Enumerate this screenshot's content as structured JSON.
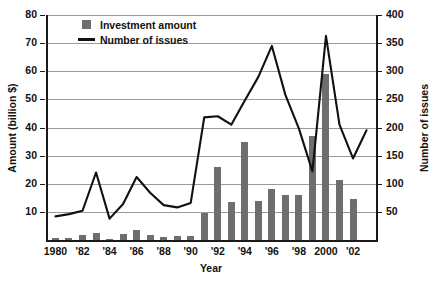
{
  "chart_data": {
    "type": "bar",
    "title": "",
    "subtitle": "",
    "xlabel": "Year",
    "ylabel": "Amount (billion $)",
    "y2label": "Number of issues",
    "grid": true,
    "legend_position": "top-left-inside",
    "x": [
      1980,
      1981,
      1982,
      1983,
      1984,
      1985,
      1986,
      1987,
      1988,
      1989,
      1990,
      1991,
      1992,
      1993,
      1994,
      1995,
      1996,
      1997,
      1998,
      1999,
      2000,
      2001,
      2002,
      2003
    ],
    "categories": [
      "1980",
      "1981",
      "1982",
      "1983",
      "1984",
      "1985",
      "1986",
      "1987",
      "1988",
      "1989",
      "1990",
      "1991",
      "1992",
      "1993",
      "1994",
      "1995",
      "1996",
      "1997",
      "1998",
      "1999",
      "2000",
      "2001",
      "2002",
      "2003"
    ],
    "xtick_labels": [
      "1980",
      "'82",
      "'84",
      "'86",
      "'88",
      "'90",
      "'92",
      "'94",
      "'96",
      "'98",
      "2000",
      "'02"
    ],
    "xtick_values": [
      1980,
      1982,
      1984,
      1986,
      1988,
      1990,
      1992,
      1994,
      1996,
      1998,
      2000,
      2002
    ],
    "xlim": [
      1979.3,
      2003.7
    ],
    "ylim": [
      0,
      80
    ],
    "ytick_labels": [
      "10",
      "20",
      "30",
      "40",
      "50",
      "60",
      "70",
      "80"
    ],
    "ytick_values": [
      10,
      20,
      30,
      40,
      50,
      60,
      70,
      80
    ],
    "y2lim": [
      0,
      400
    ],
    "y2tick_labels": [
      "50",
      "100",
      "150",
      "200",
      "250",
      "300",
      "350",
      "400"
    ],
    "y2tick_values": [
      50,
      100,
      150,
      200,
      250,
      300,
      350,
      400
    ],
    "series": [
      {
        "name": "Investment amount",
        "type": "bar",
        "axis": "left",
        "unit": "billion $",
        "color": "#6e6e6e",
        "values": [
          0.6,
          0.8,
          1.8,
          2.4,
          0.5,
          2.2,
          3.5,
          1.9,
          1.0,
          1.4,
          1.5,
          9.6,
          26.0,
          13.4,
          35.0,
          14.0,
          18.0,
          16.0,
          16.0,
          37.0,
          59.0,
          21.5,
          14.5,
          0
        ]
      },
      {
        "name": "Number of issues",
        "type": "line",
        "axis": "right",
        "unit": "issues",
        "color": "#111111",
        "values": [
          42,
          46,
          52,
          120,
          38,
          64,
          112,
          84,
          62,
          58,
          66,
          218,
          220,
          205,
          248,
          290,
          345,
          258,
          198,
          122,
          363,
          205,
          145,
          195
        ]
      }
    ],
    "legend": [
      {
        "label": "Investment amount",
        "marker": "square",
        "color": "#6e6e6e"
      },
      {
        "label": "Number of issues",
        "marker": "line",
        "color": "#111111"
      }
    ]
  }
}
